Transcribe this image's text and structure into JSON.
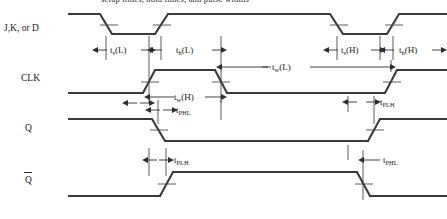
{
  "figure": {
    "clipped_title": "setup times, hold times, and pulse widths",
    "line_color": "#3a3a3a",
    "background_color": "#ffffff",
    "text_color": "#1a1a1a"
  },
  "rows": [
    {
      "id": "data",
      "label": "J,K, or D",
      "label_x": 4,
      "label_y": 31
    },
    {
      "id": "clk",
      "label": "CLK",
      "label_x": 21,
      "label_y": 81
    },
    {
      "id": "q",
      "label": "Q",
      "label_x": 25,
      "label_y": 131
    },
    {
      "id": "qbar",
      "label": "Q",
      "label_x": 25,
      "label_y": 183
    }
  ],
  "annotations": {
    "setup_low": {
      "base": "t",
      "sub": "s",
      "suffix": "(L)",
      "x": 116,
      "y": 53
    },
    "hold_low": {
      "base": "t",
      "sub": "h",
      "suffix": "(L)",
      "x": 183,
      "y": 53
    },
    "setup_high": {
      "base": "t",
      "sub": "s",
      "suffix": "(H)",
      "x": 328,
      "y": 53
    },
    "hold_high": {
      "base": "t",
      "sub": "h",
      "suffix": "(H)",
      "x": 396,
      "y": 53
    },
    "width_low": {
      "base": "t",
      "sub": "w",
      "suffix": "(L)",
      "x": 283,
      "y": 68
    },
    "width_high": {
      "base": "t",
      "sub": "w",
      "suffix": "(H)",
      "x": 183,
      "y": 98
    },
    "q_phl": {
      "base": "t",
      "sub": "PHL",
      "suffix": "",
      "x": 182,
      "y": 113
    },
    "q_plh": {
      "base": "t",
      "sub": "PLH",
      "suffix": "",
      "x": 385,
      "y": 105
    },
    "qbar_plh": {
      "base": "t",
      "sub": "PLH",
      "suffix": "",
      "x": 182,
      "y": 163
    },
    "qbar_phl": {
      "base": "t",
      "sub": "PHL",
      "suffix": "",
      "x": 385,
      "y": 163
    }
  },
  "waveforms": {
    "data": "M 68,14 L 100,14 L 112,34 L 155,34 L 168,14 L 330,14 L 343,34 L 387,34 L 399,14 L 447,14",
    "data_note": "high, fall, low, rise, high, fall, low... per drawing",
    "clk": "M 68,93 L 143,93 L 155,70 L 215,70 L 227,93 L 385,93 L 397,70 L 447,70",
    "q": "M 68,119 L 152,119 L 165,141 L 368,141 L 380,119 L 447,119",
    "qbar": "M 68,196 L 160,196 L 173,172 L 357,172 L 370,196 L 447,196"
  },
  "guides": {
    "vertical_lines_y": {
      "data_top": 10,
      "bottom": 219
    }
  }
}
